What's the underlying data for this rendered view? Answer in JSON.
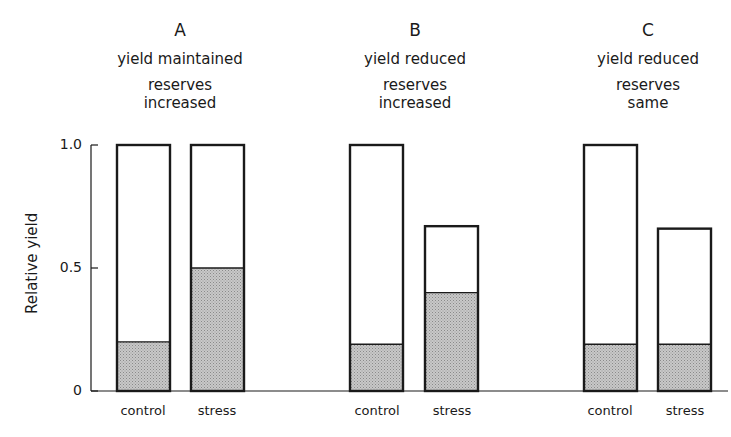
{
  "chart_data": {
    "type": "bar",
    "subtype": "stacked-overlay",
    "title": "",
    "ylabel": "Relative yield",
    "xlabel": "",
    "ylim": [
      0,
      1.0
    ],
    "yticks": [
      "0",
      "0.5",
      "1.0"
    ],
    "grid": false,
    "legend": null,
    "panels": [
      {
        "letter": "A",
        "line1": "yield maintained",
        "line2": "reserves",
        "line3": "increased",
        "categories": [
          "control",
          "stress"
        ],
        "total_yield": [
          1.0,
          1.0
        ],
        "reserves_shaded": [
          0.2,
          0.5
        ]
      },
      {
        "letter": "B",
        "line1": "yield reduced",
        "line2": "reserves",
        "line3": "increased",
        "categories": [
          "control",
          "stress"
        ],
        "total_yield": [
          1.0,
          0.67
        ],
        "reserves_shaded": [
          0.19,
          0.4
        ]
      },
      {
        "letter": "C",
        "line1": "yield reduced",
        "line2": "reserves",
        "line3": "same",
        "categories": [
          "control",
          "stress"
        ],
        "total_yield": [
          1.0,
          0.66
        ],
        "reserves_shaded": [
          0.19,
          0.19
        ]
      }
    ],
    "series": [
      {
        "name": "Total relative yield (open bar)",
        "values": [
          1.0,
          1.0,
          1.0,
          0.67,
          1.0,
          0.66
        ]
      },
      {
        "name": "Reserves (shaded portion)",
        "values": [
          0.2,
          0.5,
          0.19,
          0.4,
          0.19,
          0.19
        ]
      }
    ],
    "categories_flat": [
      "A control",
      "A stress",
      "B control",
      "B stress",
      "C control",
      "C stress"
    ]
  },
  "colors": {
    "outline": "#1a1a1a",
    "shade": "#c8c8c8",
    "background": "#ffffff"
  }
}
